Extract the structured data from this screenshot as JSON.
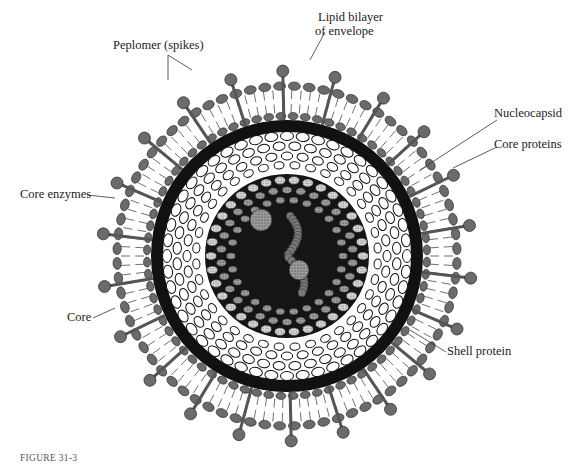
{
  "figure": {
    "caption": "FIGURE 31-3",
    "labels": {
      "peplomer": "Peplomer (spikes)",
      "lipid_line1": "Lipid bilayer",
      "lipid_line2": "of envelope",
      "nucleocapsid": "Nucleocapsid",
      "core_proteins": "Core proteins",
      "core_enzymes": "Core enzymes",
      "core": "Core",
      "shell_protein": "Shell protein"
    },
    "colors": {
      "ink": "#1a1a1a",
      "head_fill": "#6b6b6b",
      "shell_band": "#111111",
      "capsomer_fill": "#ffffff",
      "core_fill": "#8a8a8a"
    }
  }
}
